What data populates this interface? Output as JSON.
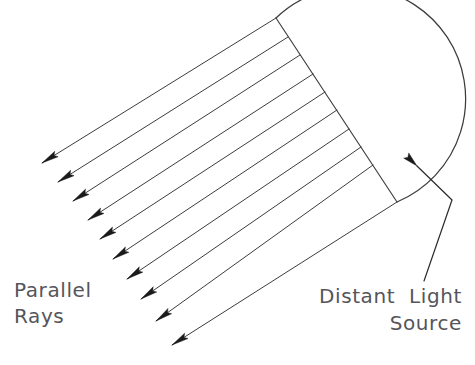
{
  "figure": {
    "title_present": false,
    "background_color": "#ffffff",
    "line_color": "#3d3d3d",
    "arrow_fill_color": "#1a1a1a",
    "text_color": "#55555a"
  },
  "labels": {
    "parallel_rays": {
      "line1": "Parallel",
      "line2": "Rays",
      "x": 14,
      "y1": 297,
      "y2": 323,
      "align": "left"
    },
    "distant_light_source": {
      "line1": "Distant  Light",
      "line2": "Source",
      "x": 462,
      "y1": 303,
      "y2": 330,
      "align": "right"
    }
  },
  "geometry": {
    "chord": {
      "x1": 276,
      "y1": 18,
      "x2": 397,
      "y2": 202
    },
    "arc": {
      "start_x": 276,
      "start_y": 18,
      "end_x": 397,
      "end_y": 202,
      "rightmost_x": 414,
      "rightmost_y": 118,
      "radius": 112,
      "sweep": "right-bulge"
    },
    "ray_count": 10,
    "ray_direction_deg": 230,
    "rays": [
      {
        "x1": 276,
        "y1": 18,
        "x2": 42,
        "y2": 163
      },
      {
        "x1": 288,
        "y1": 37,
        "x2": 58,
        "y2": 182
      },
      {
        "x1": 300,
        "y1": 55,
        "x2": 73,
        "y2": 201
      },
      {
        "x1": 313,
        "y1": 74,
        "x2": 88,
        "y2": 220
      },
      {
        "x1": 325,
        "y1": 92,
        "x2": 100,
        "y2": 239
      },
      {
        "x1": 337,
        "y1": 110,
        "x2": 113,
        "y2": 259
      },
      {
        "x1": 349,
        "y1": 129,
        "x2": 127,
        "y2": 279
      },
      {
        "x1": 361,
        "y1": 147,
        "x2": 141,
        "y2": 299
      },
      {
        "x1": 373,
        "y1": 165,
        "x2": 156,
        "y2": 321
      },
      {
        "x1": 397,
        "y1": 202,
        "x2": 172,
        "y2": 345
      }
    ],
    "leader": {
      "tip_x": 417,
      "tip_y": 166,
      "bend_x": 452,
      "bend_y": 200,
      "end_x": 424,
      "end_y": 281
    }
  }
}
